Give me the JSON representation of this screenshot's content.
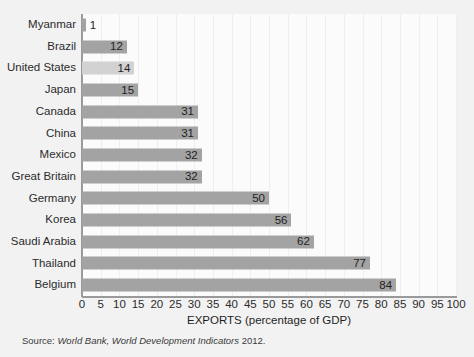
{
  "chart_data": {
    "type": "bar",
    "orientation": "horizontal",
    "title": "",
    "xlabel": "EXPORTS (percentage of GDP)",
    "ylabel": "",
    "xlim": [
      0,
      100
    ],
    "xticks": [
      0,
      5,
      10,
      15,
      20,
      25,
      30,
      35,
      40,
      45,
      50,
      55,
      60,
      65,
      70,
      75,
      80,
      85,
      90,
      95,
      100
    ],
    "grid": true,
    "legend": false,
    "categories": [
      "Myanmar",
      "Brazil",
      "United States",
      "Japan",
      "Canada",
      "China",
      "Mexico",
      "Great Britain",
      "Germany",
      "Korea",
      "Saudi Arabia",
      "Thailand",
      "Belgium"
    ],
    "values": [
      1,
      12,
      14,
      15,
      31,
      31,
      32,
      32,
      50,
      56,
      62,
      77,
      84
    ],
    "highlighted": [
      "United States"
    ],
    "bar_color": "#a3a3a3",
    "highlight_color": "#d2d2d2",
    "bars": [
      {
        "label": "Myanmar",
        "value": 1,
        "value_text": "1",
        "highlight": false,
        "label_outside": true
      },
      {
        "label": "Brazil",
        "value": 12,
        "value_text": "12",
        "highlight": false,
        "label_outside": false
      },
      {
        "label": "United States",
        "value": 14,
        "value_text": "14",
        "highlight": true,
        "label_outside": false
      },
      {
        "label": "Japan",
        "value": 15,
        "value_text": "15",
        "highlight": false,
        "label_outside": false
      },
      {
        "label": "Canada",
        "value": 31,
        "value_text": "31",
        "highlight": false,
        "label_outside": false
      },
      {
        "label": "China",
        "value": 31,
        "value_text": "31",
        "highlight": false,
        "label_outside": false
      },
      {
        "label": "Mexico",
        "value": 32,
        "value_text": "32",
        "highlight": false,
        "label_outside": false
      },
      {
        "label": "Great Britain",
        "value": 32,
        "value_text": "32",
        "highlight": false,
        "label_outside": false
      },
      {
        "label": "Germany",
        "value": 50,
        "value_text": "50",
        "highlight": false,
        "label_outside": false
      },
      {
        "label": "Korea",
        "value": 56,
        "value_text": "56",
        "highlight": false,
        "label_outside": false
      },
      {
        "label": "Saudi Arabia",
        "value": 62,
        "value_text": "62",
        "highlight": false,
        "label_outside": false
      },
      {
        "label": "Thailand",
        "value": 77,
        "value_text": "77",
        "highlight": false,
        "label_outside": false
      },
      {
        "label": "Belgium",
        "value": 84,
        "value_text": "84",
        "highlight": false,
        "label_outside": false
      }
    ]
  },
  "source": {
    "prefix": "Source: ",
    "italic": "World Bank, World Development Indicators",
    "suffix": " 2012."
  }
}
